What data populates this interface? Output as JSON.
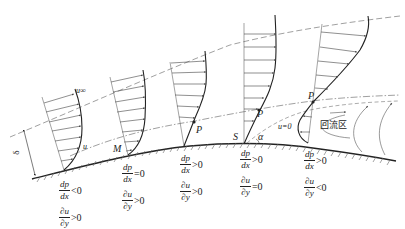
{
  "figure": {
    "labels": {
      "u_inf": "u∞",
      "u": "u",
      "delta": "δ",
      "M": "M",
      "P1": "P",
      "P2": "P",
      "P3": "P",
      "S": "S",
      "alpha": "α",
      "u_zero": "u=0",
      "recirculation": "回流区"
    },
    "stations": [
      {
        "id": "station-1",
        "dpdx": {
          "num": "dp",
          "den": "dx",
          "relation": "<0"
        },
        "dudy": {
          "num": "∂u",
          "den": "∂y",
          "relation": ">0"
        }
      },
      {
        "id": "station-2",
        "dpdx": {
          "num": "dp",
          "den": "dx",
          "relation": "=0"
        },
        "dudy": {
          "num": "∂u",
          "den": "∂y",
          "relation": ">0"
        }
      },
      {
        "id": "station-3",
        "dpdx": {
          "num": "dp",
          "den": "dx",
          "relation": ">0"
        },
        "dudy": {
          "num": "∂u",
          "den": "∂y",
          "relation": ">0"
        }
      },
      {
        "id": "station-4",
        "dpdx": {
          "num": "dp",
          "den": "dx",
          "relation": ">0"
        },
        "dudy": {
          "num": "∂u",
          "den": "∂y",
          "relation": "=0"
        }
      },
      {
        "id": "station-5",
        "dpdx": {
          "num": "dp",
          "den": "dx",
          "relation": ">0"
        },
        "dudy": {
          "num": "∂u",
          "den": "∂y",
          "relation": "<0"
        }
      }
    ],
    "colors": {
      "line": "#222222",
      "thin": "#555555",
      "dash": "#777777"
    }
  }
}
